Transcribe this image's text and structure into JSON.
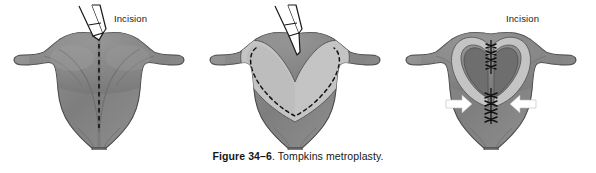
{
  "figure": {
    "caption_label": "Figure 34–6",
    "caption_text": ". Tompkins metroplasty.",
    "caption_full": "Figure 34–6. Tompkins metroplasty."
  },
  "colors": {
    "background": "#ffffff",
    "myometrium_dark": "#8b8b8b",
    "myometrium_shadow": "#6f6f6f",
    "myometrium_highlight": "#a2a2a2",
    "cavity_light": "#c2c2c2",
    "cavity_interior_dark": "#6a6a6a",
    "outline": "#3a3a3a",
    "incision_line": "#111111",
    "suture": "#111111",
    "arrow_fill": "#ffffff",
    "instrument_fill": "#ffffff",
    "instrument_stroke": "#1a1a1a",
    "label_text": "#1a1a1a",
    "caption_text": "#161616"
  },
  "panels": [
    {
      "id": "panel-1",
      "name": "step-1-incision-planned",
      "label": "Incision",
      "organ": "septate uterus",
      "annotations": {
        "incision_line_style": "dashed vertical midline",
        "instrument": "surgical knife / scalpel with two-prong handle",
        "arrows": []
      }
    },
    {
      "id": "panel-2",
      "name": "step-2-incision-opened",
      "label": "Incision",
      "organ": "uterus with opened V-shaped cavity",
      "annotations": {
        "incision_line_style": "dashed outline tracing endometrial cavity",
        "instrument": "surgical knife / scalpel with two-prong handle",
        "arrows": []
      }
    },
    {
      "id": "panel-3",
      "name": "step-3-closure-sutured",
      "label": "",
      "organ": "uterus closed with interrupted sutures",
      "annotations": {
        "incision_line_style": "none",
        "instrument": "none",
        "arrows": [
          {
            "name": "arrow-left-inward",
            "direction": "right"
          },
          {
            "name": "arrow-right-inward",
            "direction": "left"
          }
        ],
        "suture_groups": [
          {
            "name": "suture-line-upper",
            "stitches": 4
          },
          {
            "name": "suture-line-lower",
            "stitches": 4
          }
        ]
      }
    }
  ]
}
